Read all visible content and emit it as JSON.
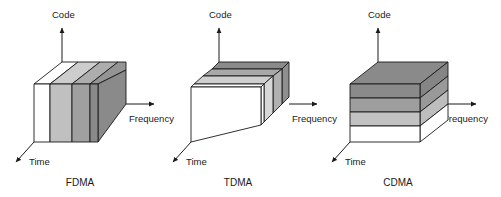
{
  "figure": {
    "background_color": "#ffffff",
    "line_color": "#1a1a1a"
  },
  "axes": {
    "code_label": "Code",
    "frequency_label": "Frequency",
    "time_label": "Time"
  },
  "palette": {
    "white": "#ffffff",
    "light_gray": "#d2d2d2",
    "mid_gray": "#b4b4b4",
    "gray": "#9a9a9a",
    "dark_gray": "#878787",
    "darker_gray": "#7a7a7a",
    "top_light": "#e8e8e8",
    "top_mid": "#c6c6c6",
    "top_dark": "#9f9f9f"
  },
  "diagrams": [
    {
      "id": "fdma",
      "caption": "FDMA",
      "division_axis": "frequency",
      "slice_count": 4,
      "slice_colors": [
        "#ffffff",
        "#c0c0c0",
        "#a0a0a0",
        "#8a8a8a"
      ],
      "top_colors": [
        "#ffffff",
        "#cdcdcd",
        "#adadad",
        "#949494"
      ],
      "side_color": "#8a8a8a",
      "code_label": "Code",
      "frequency_label": "Frequency",
      "time_label": "Time"
    },
    {
      "id": "tdma",
      "caption": "TDMA",
      "division_axis": "time",
      "slice_count": 4,
      "slice_colors": [
        "#ffffff",
        "#d8d8d8",
        "#b0b0b0",
        "#8f8f8f"
      ],
      "top_colors": [
        "#ffffff",
        "#d0d0d0",
        "#a8a8a8",
        "#8a8a8a"
      ],
      "side_color": "#c8c8c8",
      "code_label": "Code",
      "frequency_label": "Frequency",
      "time_label": "Time"
    },
    {
      "id": "cdma",
      "caption": "CDMA",
      "division_axis": "code",
      "slice_count": 4,
      "slice_colors": [
        "#8a8a8a",
        "#9e9e9e",
        "#c2c2c2",
        "#ffffff"
      ],
      "top_colors": [
        "#8a8a8a",
        "#9e9e9e",
        "#c2c2c2",
        "#ffffff"
      ],
      "side_color": "#9a9a9a",
      "code_label": "Code",
      "frequency_label": "Frequency",
      "time_label": "Time"
    }
  ]
}
